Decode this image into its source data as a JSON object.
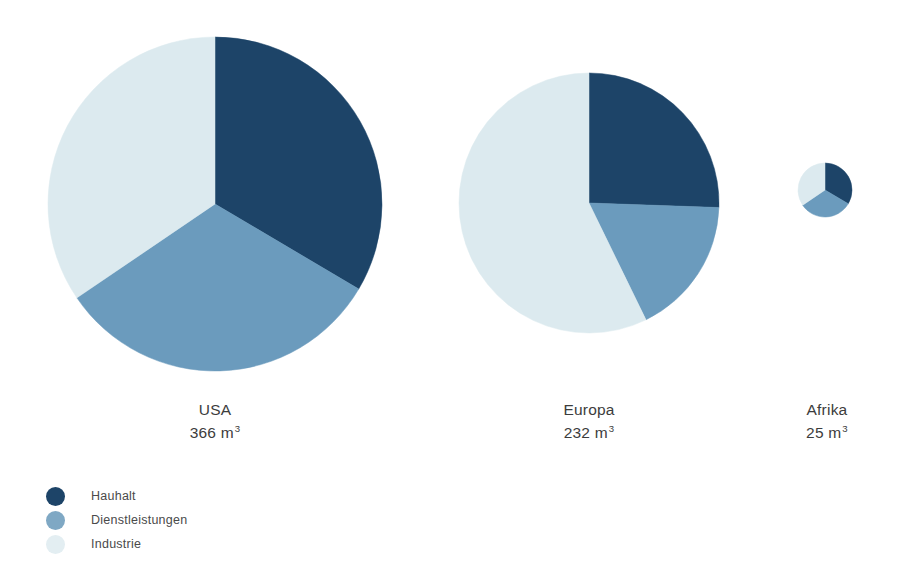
{
  "chart_data": {
    "type": "pie",
    "title": "",
    "subtitle": "",
    "xlabel": "",
    "ylabel": "",
    "grid": false,
    "legend_position": "bottom-left",
    "note": "Three proportional pie charts; circle area scales with the total water use value shown under each pie.",
    "categories": [
      "Hauhalt",
      "Dienstleistungen",
      "Industrie"
    ],
    "colors": {
      "hauhalt": "#1d4468",
      "dienstleistungen": "#6b9bbd",
      "industrie": "#dceaef",
      "background": "#ffffff",
      "text": "#3c3c3c"
    },
    "unit": "m³",
    "pies": [
      {
        "name": "USA",
        "total": 366,
        "total_label": "366 m",
        "unit_exponent": "3",
        "center": [
          215,
          204
        ],
        "radius": 167,
        "slices": [
          {
            "category": "Hauhalt",
            "percent": 33.5,
            "start_angle": 0,
            "end_angle": 120.6,
            "color": "#1d4468"
          },
          {
            "category": "Dienstleistungen",
            "percent": 32.0,
            "start_angle": 120.6,
            "end_angle": 235.8,
            "color": "#6b9bbd"
          },
          {
            "category": "Industrie",
            "percent": 34.5,
            "start_angle": 235.8,
            "end_angle": 360,
            "color": "#dceaef"
          }
        ]
      },
      {
        "name": "Europa",
        "total": 232,
        "total_label": "232 m",
        "unit_exponent": "3",
        "center": [
          589,
          203
        ],
        "radius": 130,
        "slices": [
          {
            "category": "Hauhalt",
            "percent": 25.6,
            "start_angle": 0,
            "end_angle": 92.0,
            "color": "#1d4468"
          },
          {
            "category": "Dienstleistungen",
            "percent": 17.2,
            "start_angle": 92.0,
            "end_angle": 154.0,
            "color": "#6b9bbd"
          },
          {
            "category": "Industrie",
            "percent": 57.2,
            "start_angle": 154.0,
            "end_angle": 360,
            "color": "#dceaef"
          }
        ]
      },
      {
        "name": "Afrika",
        "total": 25,
        "total_label": "25 m",
        "unit_exponent": "3",
        "center": [
          825,
          190
        ],
        "radius": 27,
        "slices": [
          {
            "category": "Hauhalt",
            "percent": 33.5,
            "start_angle": 0,
            "end_angle": 120.6,
            "color": "#1d4468"
          },
          {
            "category": "Dienstleistungen",
            "percent": 32.0,
            "start_angle": 120.6,
            "end_angle": 235.8,
            "color": "#6b9bbd"
          },
          {
            "category": "Industrie",
            "percent": 34.5,
            "start_angle": 235.8,
            "end_angle": 360,
            "color": "#dceaef"
          }
        ]
      }
    ]
  },
  "captions": [
    {
      "region": "USA",
      "value": "366 m",
      "exp": "3",
      "left": 150,
      "top": 398,
      "width": 130
    },
    {
      "region": "Europa",
      "value": "232 m",
      "exp": "3",
      "left": 524,
      "top": 398,
      "width": 130
    },
    {
      "region": "Afrika",
      "value": "25 m",
      "exp": "3",
      "left": 762,
      "top": 398,
      "width": 130
    }
  ],
  "legend": {
    "items": [
      {
        "label": "Hauhalt",
        "color": "#1d4468"
      },
      {
        "label": "Dienstleistungen",
        "color": "#7fa8c4"
      },
      {
        "label": "Industrie",
        "color": "#e3eef2"
      }
    ]
  }
}
